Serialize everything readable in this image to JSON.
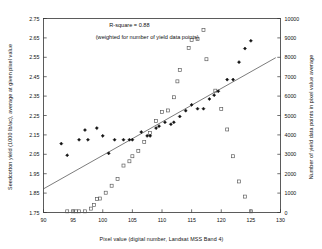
{
  "chart_data": {
    "type": "scatter",
    "title": "",
    "xlabel": "Pixel value (digital number, Landsat MSS Band 4)",
    "ylabel": "Seedcotton yield (1000 lb/ac), average at given pixel value",
    "ylabel_right": "Number of yield data points in pixel value average",
    "xlim": [
      90,
      130
    ],
    "ylim": [
      1.75,
      2.75
    ],
    "ylim_right": [
      0,
      10000
    ],
    "xticks": [
      90,
      95,
      100,
      105,
      110,
      115,
      120,
      125,
      130
    ],
    "xticklabels": [
      "90",
      "95",
      "100",
      "105",
      "110",
      "115",
      "120",
      "125",
      "130"
    ],
    "yticks": [
      1.75,
      1.85,
      1.95,
      2.05,
      2.15,
      2.25,
      2.35,
      2.45,
      2.55,
      2.65,
      2.75
    ],
    "yticklabels": [
      "1.75",
      "1.85",
      "1.95",
      "2.05",
      "2.15",
      "2.25",
      "2.35",
      "2.45",
      "2.55",
      "2.65",
      "2.75"
    ],
    "yticks_right": [
      0,
      1000,
      2000,
      3000,
      4000,
      5000,
      6000,
      7000,
      8000,
      9000,
      10000
    ],
    "yticklabels_right": [
      "0",
      "1000",
      "2000",
      "3000",
      "4000",
      "5000",
      "6000",
      "7000",
      "8000",
      "9000",
      "10000"
    ],
    "grid": false,
    "legend": "none",
    "annotations": [
      {
        "text": "R-square = 0.88",
        "x": 104.5,
        "y": 2.715
      },
      {
        "text": "(weighted for number of yield data points)",
        "x": 107.5,
        "y": 2.655
      }
    ],
    "series": [
      {
        "name": "Seedcotton yield average",
        "marker": "filled-diamond",
        "color": "#111111",
        "axis": "left",
        "points": [
          [
            93.0,
            2.105
          ],
          [
            94.0,
            2.045
          ],
          [
            96.0,
            2.125
          ],
          [
            97.0,
            2.175
          ],
          [
            97.5,
            2.125
          ],
          [
            99.0,
            2.185
          ],
          [
            100.0,
            2.145
          ],
          [
            101.0,
            2.055
          ],
          [
            102.0,
            2.125
          ],
          [
            103.5,
            2.125
          ],
          [
            104.5,
            2.125
          ],
          [
            105.0,
            2.125
          ],
          [
            106.5,
            2.165
          ],
          [
            107.5,
            2.145
          ],
          [
            108.0,
            2.145
          ],
          [
            109.0,
            2.185
          ],
          [
            109.5,
            2.195
          ],
          [
            110.5,
            2.215
          ],
          [
            111.5,
            2.205
          ],
          [
            112.0,
            2.215
          ],
          [
            113.0,
            2.245
          ],
          [
            114.0,
            2.275
          ],
          [
            115.0,
            2.305
          ],
          [
            116.0,
            2.285
          ],
          [
            117.0,
            2.285
          ],
          [
            118.0,
            2.335
          ],
          [
            118.8,
            2.355
          ],
          [
            119.5,
            2.375
          ],
          [
            121.0,
            2.435
          ],
          [
            122.0,
            2.435
          ],
          [
            123.0,
            2.525
          ],
          [
            124.0,
            2.595
          ],
          [
            125.0,
            2.635
          ]
        ]
      },
      {
        "name": "Number of yield data points",
        "marker": "open-square",
        "color": "#555555",
        "axis": "right",
        "points": [
          [
            94.0,
            60
          ],
          [
            95.0,
            60
          ],
          [
            95.5,
            60
          ],
          [
            96.0,
            60
          ],
          [
            97.0,
            60
          ],
          [
            98.0,
            200
          ],
          [
            98.5,
            380
          ],
          [
            99.0,
            700
          ],
          [
            99.5,
            720
          ],
          [
            100.5,
            1020
          ],
          [
            101.5,
            1380
          ],
          [
            102.5,
            1720
          ],
          [
            103.5,
            2420
          ],
          [
            104.5,
            2640
          ],
          [
            105.0,
            2900
          ],
          [
            106.0,
            3180
          ],
          [
            107.0,
            3640
          ],
          [
            108.0,
            4100
          ],
          [
            109.0,
            4720
          ],
          [
            110.0,
            5180
          ],
          [
            111.0,
            5260
          ],
          [
            112.0,
            5940
          ],
          [
            112.6,
            6760
          ],
          [
            113.0,
            7340
          ],
          [
            114.5,
            8480
          ],
          [
            115.0,
            8900
          ],
          [
            116.0,
            8940
          ],
          [
            117.0,
            9400
          ],
          [
            117.5,
            7900
          ],
          [
            119.0,
            6280
          ],
          [
            120.0,
            5340
          ],
          [
            121.0,
            4280
          ],
          [
            122.0,
            2900
          ],
          [
            123.0,
            1600
          ],
          [
            124.0,
            820
          ],
          [
            125.0,
            60
          ]
        ]
      }
    ],
    "trendline": {
      "name": "weighted regression line",
      "color": "#444444",
      "x0": 90.0,
      "y0": 1.872,
      "x1": 129.2,
      "y1": 2.548
    }
  }
}
